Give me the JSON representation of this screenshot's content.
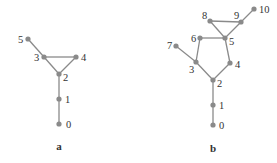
{
  "colors": {
    "edge": "#8a8a8a",
    "node": "#8a8a8a",
    "text": "#333333",
    "background": "#ffffff"
  },
  "graphs": [
    {
      "caption": "a",
      "caption_pos": [
        59,
        150
      ],
      "nodes": [
        {
          "id": "0",
          "x": 59,
          "y": 124,
          "lx": 66,
          "ly": 128
        },
        {
          "id": "1",
          "x": 59,
          "y": 99,
          "lx": 65,
          "ly": 103
        },
        {
          "id": "2",
          "x": 59,
          "y": 74,
          "lx": 63,
          "ly": 81
        },
        {
          "id": "3",
          "x": 44,
          "y": 57,
          "lx": 34,
          "ly": 61
        },
        {
          "id": "4",
          "x": 76,
          "y": 57,
          "lx": 81,
          "ly": 61
        },
        {
          "id": "5",
          "x": 28,
          "y": 39,
          "lx": 18,
          "ly": 43
        }
      ],
      "edges": [
        [
          "0",
          "1"
        ],
        [
          "1",
          "2"
        ],
        [
          "2",
          "3"
        ],
        [
          "2",
          "4"
        ],
        [
          "3",
          "4"
        ],
        [
          "3",
          "5"
        ]
      ]
    },
    {
      "caption": "b",
      "caption_pos": [
        213,
        152
      ],
      "nodes": [
        {
          "id": "0",
          "x": 213,
          "y": 125,
          "lx": 219,
          "ly": 129
        },
        {
          "id": "1",
          "x": 213,
          "y": 105,
          "lx": 219,
          "ly": 109
        },
        {
          "id": "2",
          "x": 213,
          "y": 80,
          "lx": 217,
          "ly": 87
        },
        {
          "id": "3",
          "x": 196,
          "y": 62,
          "lx": 189,
          "ly": 73
        },
        {
          "id": "4",
          "x": 230,
          "y": 63,
          "lx": 235,
          "ly": 68
        },
        {
          "id": "5",
          "x": 225,
          "y": 38,
          "lx": 229,
          "ly": 45
        },
        {
          "id": "6",
          "x": 200,
          "y": 38,
          "lx": 191,
          "ly": 42
        },
        {
          "id": "7",
          "x": 176,
          "y": 46,
          "lx": 167,
          "ly": 49
        },
        {
          "id": "8",
          "x": 210,
          "y": 21,
          "lx": 202,
          "ly": 19
        },
        {
          "id": "9",
          "x": 241,
          "y": 22,
          "lx": 234,
          "ly": 19
        },
        {
          "id": "10",
          "x": 254,
          "y": 9,
          "lx": 259,
          "ly": 13
        }
      ],
      "edges": [
        [
          "0",
          "1"
        ],
        [
          "1",
          "2"
        ],
        [
          "2",
          "3"
        ],
        [
          "2",
          "4"
        ],
        [
          "3",
          "6"
        ],
        [
          "3",
          "7"
        ],
        [
          "4",
          "5"
        ],
        [
          "5",
          "6"
        ],
        [
          "5",
          "8"
        ],
        [
          "5",
          "9"
        ],
        [
          "8",
          "9"
        ],
        [
          "9",
          "10"
        ]
      ]
    }
  ]
}
